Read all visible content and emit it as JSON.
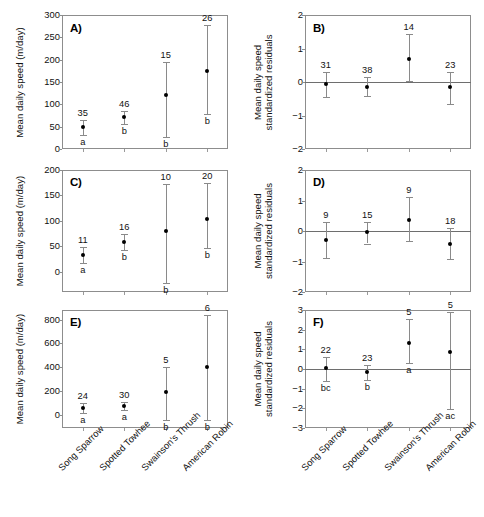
{
  "figure": {
    "panel_letters": [
      "A)",
      "B)",
      "C)",
      "D)",
      "E)",
      "F)"
    ],
    "species": [
      "Song Sparrow",
      "Spotted Towhee",
      "Swainson's Thrush",
      "American Robin"
    ],
    "axis_titles": {
      "speed": "Mean daily speed (m/day)",
      "residual_line1": "Mean daily speed",
      "residual_line2": "standardized residuals"
    },
    "marker_color": "#000000",
    "errorbar_color": "#8a8a8a",
    "axis_color": "#8d8d8d"
  },
  "chart_data": [
    {
      "panel": "A)",
      "type": "scatter",
      "title": "A)",
      "xlabel": "",
      "ylabel": "Mean daily speed (m/day)",
      "categories": [
        "Song Sparrow",
        "Spotted Towhee",
        "Swainson's Thrush",
        "American Robin"
      ],
      "values": [
        50,
        72,
        120,
        174
      ],
      "err_low": [
        32,
        57,
        27,
        78
      ],
      "err_high": [
        64,
        86,
        194,
        278
      ],
      "sample_sizes": [
        "35",
        "46",
        "15",
        "26"
      ],
      "group_letters": [
        "a",
        "b",
        "b",
        "b"
      ],
      "yticks": [
        0,
        50,
        100,
        150,
        200,
        250,
        300
      ],
      "ylim": [
        0,
        300
      ],
      "grid": false,
      "zero_line": false
    },
    {
      "panel": "B)",
      "type": "scatter",
      "title": "B)",
      "xlabel": "",
      "ylabel": "Mean daily speed standardized residuals",
      "categories": [
        "Song Sparrow",
        "Spotted Towhee",
        "Swainson's Thrush",
        "American Robin"
      ],
      "values": [
        -0.07,
        -0.14,
        0.7,
        -0.16
      ],
      "err_low": [
        -0.44,
        -0.42,
        0.03,
        -0.67
      ],
      "err_high": [
        0.3,
        0.15,
        1.42,
        0.31
      ],
      "sample_sizes": [
        "31",
        "38",
        "14",
        "23"
      ],
      "group_letters": [
        "",
        "",
        "",
        ""
      ],
      "yticks": [
        -2,
        -1,
        0,
        1,
        2
      ],
      "ylim": [
        -2,
        2
      ],
      "grid": false,
      "zero_line": true
    },
    {
      "panel": "C)",
      "type": "scatter",
      "title": "C)",
      "xlabel": "",
      "ylabel": "Mean daily speed (m/day)",
      "categories": [
        "Song Sparrow",
        "Spotted Towhee",
        "Swainson's Thrush",
        "American Robin"
      ],
      "values": [
        33,
        58,
        80,
        104
      ],
      "err_low": [
        18,
        42,
        -22,
        46
      ],
      "err_high": [
        48,
        75,
        172,
        175
      ],
      "sample_sizes": [
        "11",
        "16",
        "10",
        "20"
      ],
      "group_letters": [
        "a",
        "b",
        "b",
        "b"
      ],
      "yticks": [
        0,
        50,
        100,
        150,
        200
      ],
      "ylim": [
        -40,
        200
      ],
      "grid": false,
      "zero_line": false
    },
    {
      "panel": "D)",
      "type": "scatter",
      "title": "D)",
      "xlabel": "",
      "ylabel": "Mean daily speed standardized residuals",
      "categories": [
        "Song Sparrow",
        "Spotted Towhee",
        "Swainson's Thrush",
        "American Robin"
      ],
      "values": [
        -0.31,
        -0.04,
        0.37,
        -0.42
      ],
      "err_low": [
        -0.89,
        -0.41,
        -0.34,
        -0.92
      ],
      "err_high": [
        0.28,
        0.28,
        1.1,
        0.1
      ],
      "sample_sizes": [
        "9",
        "15",
        "9",
        "18"
      ],
      "group_letters": [
        "",
        "",
        "",
        ""
      ],
      "yticks": [
        -2,
        -1,
        0,
        1,
        2
      ],
      "ylim": [
        -2,
        2
      ],
      "grid": false,
      "zero_line": true
    },
    {
      "panel": "E)",
      "type": "scatter",
      "title": "E)",
      "xlabel": "",
      "ylabel": "Mean daily speed (m/day)",
      "categories": [
        "Song Sparrow",
        "Spotted Towhee",
        "Swainson's Thrush",
        "American Robin"
      ],
      "values": [
        60,
        75,
        193,
        402
      ],
      "err_low": [
        20,
        45,
        -40,
        -40
      ],
      "err_high": [
        100,
        108,
        400,
        840
      ],
      "sample_sizes": [
        "24",
        "30",
        "5",
        "6"
      ],
      "group_letters": [
        "a",
        "a",
        "b",
        "b"
      ],
      "yticks": [
        0,
        200,
        400,
        600,
        800
      ],
      "ylim": [
        -110,
        880
      ],
      "grid": false,
      "zero_line": false
    },
    {
      "panel": "F)",
      "type": "scatter",
      "title": "F)",
      "xlabel": "",
      "ylabel": "Mean daily speed standardized residuals",
      "categories": [
        "Song Sparrow",
        "Spotted Towhee",
        "Swainson's Thrush",
        "American Robin"
      ],
      "values": [
        0.04,
        -0.17,
        1.32,
        0.84
      ],
      "err_low": [
        -0.62,
        -0.58,
        0.28,
        -2.05
      ],
      "err_high": [
        0.62,
        0.2,
        2.52,
        2.88
      ],
      "sample_sizes": [
        "22",
        "23",
        "5",
        "5"
      ],
      "group_letters": [
        "bc",
        "b",
        "a",
        "ac"
      ],
      "yticks": [
        -3,
        -2,
        -1,
        0,
        1,
        2,
        3
      ],
      "ylim": [
        -3,
        3
      ],
      "grid": false,
      "zero_line": true
    }
  ]
}
